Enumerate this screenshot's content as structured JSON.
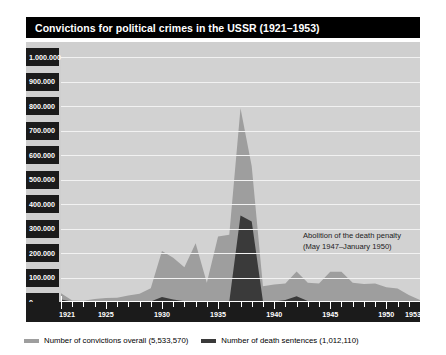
{
  "title": "Convictions for political crimes in the USSR (1921–1953)",
  "annotation": {
    "line1": "Abolition of the death penalty",
    "line2": "(May 1947–January 1950)"
  },
  "legend": [
    {
      "label": "Number of convictions overall (5,533,570)",
      "color": "#9e9e9e"
    },
    {
      "label": "Number of death sentences (1,012,110)",
      "color": "#3a3a3a"
    }
  ],
  "colors": {
    "title_bar": "#000000",
    "title_text": "#ffffff",
    "plot_background": "#d2d2d2",
    "frame_background": "#cfcfcf",
    "gridline": "#f2f2f2",
    "axis_strip": "#1b1b1b",
    "axis_text": "#ffffff",
    "series_overall": "#9e9e9e",
    "series_death": "#3a3a3a",
    "annotation_text": "#1b1b1b"
  },
  "chart_data": {
    "type": "area",
    "title": "Convictions for political crimes in the USSR (1921–1953)",
    "xlabel": "",
    "ylabel": "",
    "xlim": [
      1921,
      1953
    ],
    "ylim": [
      0,
      1000000
    ],
    "grid": true,
    "legend_position": "bottom-left",
    "x": [
      1921,
      1922,
      1923,
      1924,
      1925,
      1926,
      1927,
      1928,
      1929,
      1930,
      1931,
      1932,
      1933,
      1934,
      1935,
      1936,
      1937,
      1938,
      1939,
      1940,
      1941,
      1942,
      1943,
      1944,
      1945,
      1946,
      1947,
      1948,
      1949,
      1950,
      1951,
      1952,
      1953
    ],
    "xticks": [
      1921,
      1925,
      1930,
      1935,
      1940,
      1945,
      1950,
      1953
    ],
    "xticklabels": [
      "1921",
      "1925",
      "1930",
      "1935",
      "1940",
      "1945",
      "1950",
      "1953"
    ],
    "yticks": [
      0,
      100000,
      200000,
      300000,
      400000,
      500000,
      600000,
      700000,
      800000,
      900000,
      1000000
    ],
    "yticklabels": [
      "0",
      "100.000",
      "200.000",
      "300.000",
      "400.000",
      "500.000",
      "600.000",
      "700.000",
      "800.000",
      "900.000",
      "1.000.000"
    ],
    "series": [
      {
        "name": "Number of convictions overall (5,533,570)",
        "total": 5533570,
        "color": "#9e9e9e",
        "values": [
          35829,
          6003,
          4794,
          12425,
          15995,
          17804,
          26036,
          33757,
          56220,
          208069,
          180696,
          141919,
          239664,
          78999,
          267076,
          274670,
          790665,
          554258,
          63889,
          71806,
          75411,
          124406,
          78441,
          75109,
          123248,
          123294,
          78810,
          73269,
          75125,
          60641,
          54775,
          28800,
          8403
        ]
      },
      {
        "name": "Number of death sentences (1,012,110)",
        "total": 1012110,
        "color": "#3a3a3a",
        "values": [
          9701,
          1962,
          414,
          2550,
          2433,
          990,
          2363,
          869,
          2109,
          20201,
          10651,
          2728,
          2154,
          2056,
          1229,
          1118,
          353074,
          328618,
          2552,
          1649,
          8011,
          23278,
          3579,
          3029,
          4252,
          2896,
          1105,
          0,
          0,
          0,
          1612,
          1612,
          198
        ]
      }
    ],
    "annotations": [
      {
        "text": "Abolition of the death penalty (May 1947–January 1950)",
        "x_range": [
          1947,
          1950
        ]
      }
    ]
  }
}
